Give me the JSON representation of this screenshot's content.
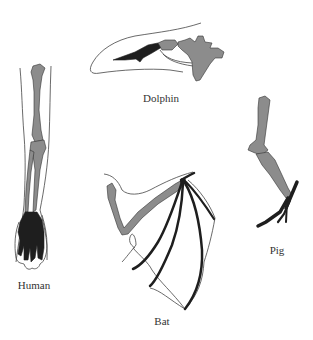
{
  "figure": {
    "colors": {
      "background": "#ffffff",
      "upper_bones": "#8c8c8c",
      "hand_bones": "#1e1e1e",
      "outline": "#444444",
      "label_text": "#333333"
    },
    "specimens": [
      {
        "id": "dolphin",
        "label": "Dolphin"
      },
      {
        "id": "human",
        "label": "Human"
      },
      {
        "id": "bat",
        "label": "Bat"
      },
      {
        "id": "pig",
        "label": "Pig"
      }
    ]
  }
}
